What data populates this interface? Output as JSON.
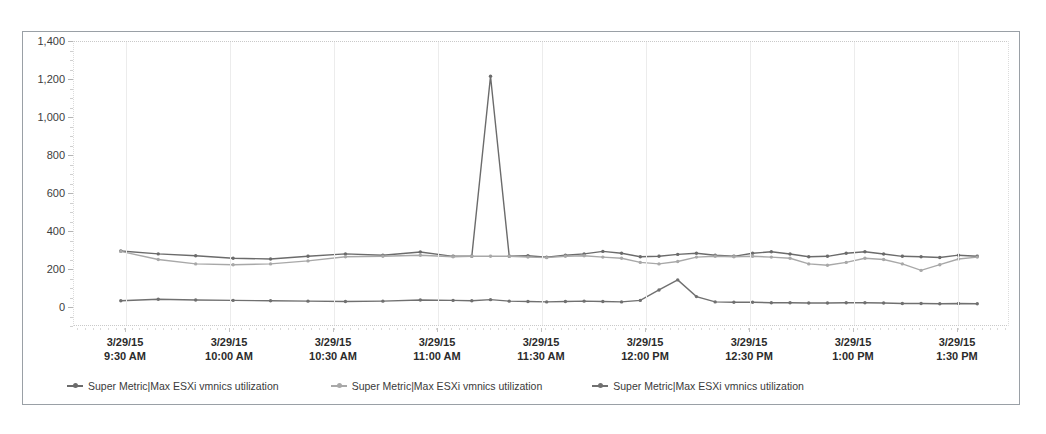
{
  "chart_data": {
    "type": "line",
    "title": "",
    "xlabel": "",
    "ylabel": "",
    "ylim": [
      -100,
      1400
    ],
    "yticks": [
      0,
      200,
      400,
      600,
      800,
      1000,
      1200,
      1400
    ],
    "ytick_labels": [
      "0",
      "200",
      "400",
      "600",
      "800",
      "1,000",
      "1,200",
      "1,400"
    ],
    "grid": true,
    "legend_position": "bottom",
    "x_axis_ticks": [
      {
        "date": "3/29/15",
        "time": "9:30 AM"
      },
      {
        "date": "3/29/15",
        "time": "10:00 AM"
      },
      {
        "date": "3/29/15",
        "time": "10:30 AM"
      },
      {
        "date": "3/29/15",
        "time": "11:00 AM"
      },
      {
        "date": "3/29/15",
        "time": "11:30 AM"
      },
      {
        "date": "3/29/15",
        "time": "12:00 PM"
      },
      {
        "date": "3/29/15",
        "time": "12:30 PM"
      },
      {
        "date": "3/29/15",
        "time": "1:00 PM"
      },
      {
        "date": "3/29/15",
        "time": "1:30 PM"
      }
    ],
    "x_range_start": "3/29/15 9:18 AM",
    "x_range_end": "3/29/15 1:42 PM",
    "series": [
      {
        "name": "Super Metric|Max ESXi vmnics utilization",
        "color": "#6b6b6b",
        "marker": "circle",
        "x": [
          0.05,
          0.09,
          0.13,
          0.17,
          0.21,
          0.25,
          0.29,
          0.33,
          0.37,
          0.405,
          0.425,
          0.445,
          0.465,
          0.485,
          0.505,
          0.525,
          0.545,
          0.565,
          0.585,
          0.605,
          0.625,
          0.645,
          0.665,
          0.685,
          0.705,
          0.725,
          0.745,
          0.765,
          0.785,
          0.805,
          0.825,
          0.845,
          0.865,
          0.885,
          0.905,
          0.925,
          0.945,
          0.965
        ],
        "values": [
          300,
          285,
          275,
          262,
          258,
          272,
          285,
          278,
          295,
          272,
          272,
          1220,
          272,
          275,
          268,
          278,
          285,
          298,
          288,
          270,
          272,
          282,
          288,
          278,
          272,
          288,
          296,
          284,
          270,
          272,
          288,
          296,
          284,
          272,
          270,
          266,
          278,
          272
        ],
        "notes": "upper dark series; sharp spike to ~1,220 at ~11:00 AM"
      },
      {
        "name": "Super Metric|Max ESXi vmnics utilization",
        "color": "#a8a8a8",
        "marker": "circle",
        "x": [
          0.05,
          0.09,
          0.13,
          0.17,
          0.21,
          0.25,
          0.29,
          0.33,
          0.37,
          0.405,
          0.425,
          0.445,
          0.465,
          0.485,
          0.505,
          0.525,
          0.545,
          0.565,
          0.585,
          0.605,
          0.625,
          0.645,
          0.665,
          0.685,
          0.705,
          0.725,
          0.745,
          0.765,
          0.785,
          0.805,
          0.825,
          0.845,
          0.865,
          0.885,
          0.905,
          0.925,
          0.945,
          0.965
        ],
        "values": [
          298,
          255,
          232,
          228,
          232,
          248,
          270,
          272,
          278,
          270,
          272,
          272,
          272,
          268,
          265,
          272,
          275,
          268,
          262,
          240,
          232,
          245,
          268,
          272,
          270,
          272,
          268,
          262,
          232,
          225,
          240,
          262,
          255,
          232,
          198,
          228,
          258,
          268
        ],
        "notes": "upper light-gray series; tracks below dark series with dips"
      },
      {
        "name": "Super Metric|Max ESXi vmnics utilization",
        "color": "#707070",
        "marker": "circle",
        "x": [
          0.05,
          0.09,
          0.13,
          0.17,
          0.21,
          0.25,
          0.29,
          0.33,
          0.37,
          0.405,
          0.425,
          0.445,
          0.465,
          0.485,
          0.505,
          0.525,
          0.545,
          0.565,
          0.585,
          0.605,
          0.625,
          0.645,
          0.665,
          0.685,
          0.705,
          0.725,
          0.745,
          0.765,
          0.785,
          0.805,
          0.825,
          0.845,
          0.865,
          0.885,
          0.905,
          0.925,
          0.945,
          0.965
        ],
        "values": [
          38,
          46,
          42,
          40,
          38,
          36,
          34,
          36,
          42,
          40,
          38,
          44,
          36,
          34,
          32,
          34,
          36,
          34,
          32,
          40,
          95,
          148,
          60,
          32,
          30,
          30,
          28,
          28,
          26,
          26,
          28,
          28,
          26,
          24,
          24,
          22,
          24,
          22
        ],
        "notes": "lower series near baseline ~20-45; bump to ~150 near 12:20 PM"
      }
    ]
  }
}
